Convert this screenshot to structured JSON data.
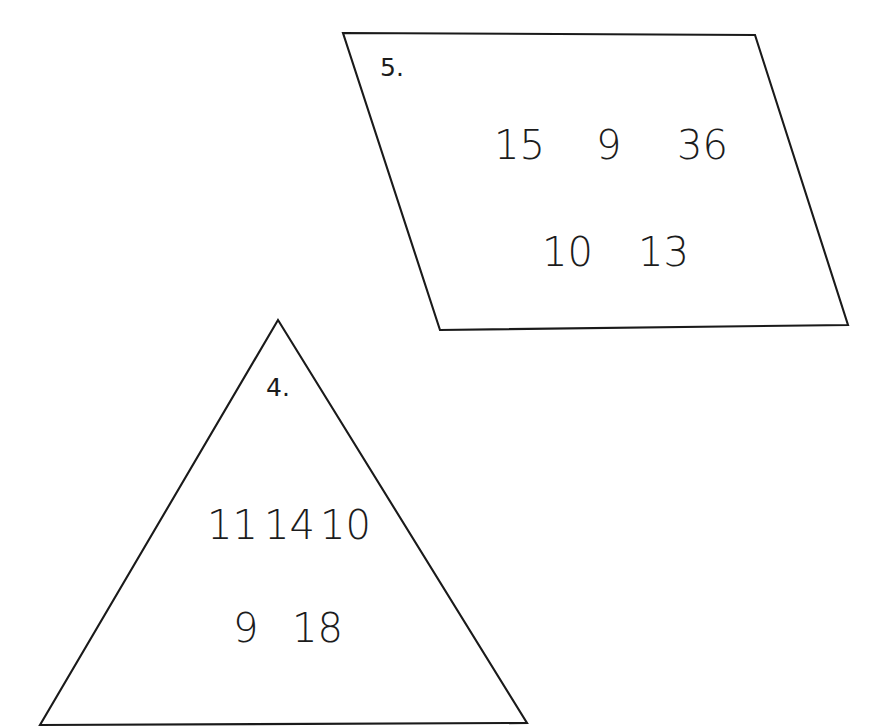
{
  "page": {
    "width": 879,
    "height": 728,
    "background_color": "#ffffff",
    "ink_color": "#1a1a1a"
  },
  "edge_artifact": {
    "description": "faint cut-off gray text fragments along extreme left margin",
    "color": "#c9c9c9",
    "fragments": [
      "y",
      "e",
      "a",
      "r",
      ".",
      "o",
      "c",
      "g",
      "e"
    ]
  },
  "shapes": [
    {
      "id": "parallelogram",
      "type": "parallelogram",
      "label": "5.",
      "label_position": {
        "x": 380,
        "y": 55
      },
      "points": "343,33 755,35 848,325 440,330",
      "rows": [
        {
          "id": "row-1",
          "y": 125,
          "numbers": [
            {
              "value": "15",
              "x": 494
            },
            {
              "value": "9",
              "x": 596
            },
            {
              "value": "36",
              "x": 677
            }
          ]
        },
        {
          "id": "row-2",
          "y": 232,
          "numbers": [
            {
              "value": "10",
              "x": 542
            },
            {
              "value": "13",
              "x": 638
            }
          ]
        }
      ]
    },
    {
      "id": "triangle",
      "type": "triangle",
      "label": "4.",
      "label_position": {
        "x": 266,
        "y": 375
      },
      "points": "278,320 527,723 40,725",
      "rows": [
        {
          "id": "row-1",
          "y": 505,
          "numbers": [
            {
              "value": "11",
              "x": 207
            },
            {
              "value": "14",
              "x": 264
            },
            {
              "value": "10",
              "x": 320
            }
          ]
        },
        {
          "id": "row-2",
          "y": 608,
          "numbers": [
            {
              "value": "9",
              "x": 233
            },
            {
              "value": "18",
              "x": 292
            }
          ]
        }
      ]
    }
  ],
  "chart_data": {
    "type": "table",
    "title": "",
    "items": [
      {
        "problem_number": "5.",
        "shape": "parallelogram",
        "values": [
          15,
          9,
          36,
          10,
          13
        ]
      },
      {
        "problem_number": "4.",
        "shape": "triangle",
        "values": [
          11,
          14,
          10,
          9,
          18
        ]
      }
    ]
  }
}
